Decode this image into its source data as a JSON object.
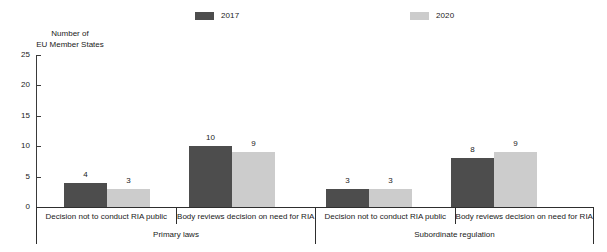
{
  "chart_data": {
    "type": "bar",
    "title": "",
    "subtitle": "",
    "xlabel": "",
    "ylabel": "Number of\nEU Member States",
    "ylabel_line1": "Number of",
    "ylabel_line2": "EU Member States",
    "ylim": [
      0,
      25
    ],
    "ytick_labels": [
      "0",
      "5",
      "10",
      "15",
      "20",
      "25"
    ],
    "ytick_values": [
      0,
      5,
      10,
      15,
      20,
      25
    ],
    "grid": false,
    "legend_position": "top",
    "categories": [
      "Decision not to conduct RIA public",
      "Body reviews decision on need for RIA",
      "Decision not to conduct RIA public",
      "Body reviews decision on need for RIA"
    ],
    "groups": [
      {
        "label": "Primary laws",
        "span": [
          0,
          1
        ]
      },
      {
        "label": "Subordinate regulation",
        "span": [
          2,
          3
        ]
      }
    ],
    "series": [
      {
        "name": "2017",
        "color": "#4d4d4d",
        "values": [
          4,
          10,
          3,
          8
        ]
      },
      {
        "name": "2020",
        "color": "#cccccc",
        "values": [
          3,
          9,
          3,
          9
        ]
      }
    ]
  },
  "legend": {
    "items": [
      {
        "label": "2017",
        "color": "#4d4d4d"
      },
      {
        "label": "2020",
        "color": "#cccccc"
      }
    ]
  },
  "axis": {
    "title_line1": "Number of",
    "title_line2": "EU Member States"
  }
}
